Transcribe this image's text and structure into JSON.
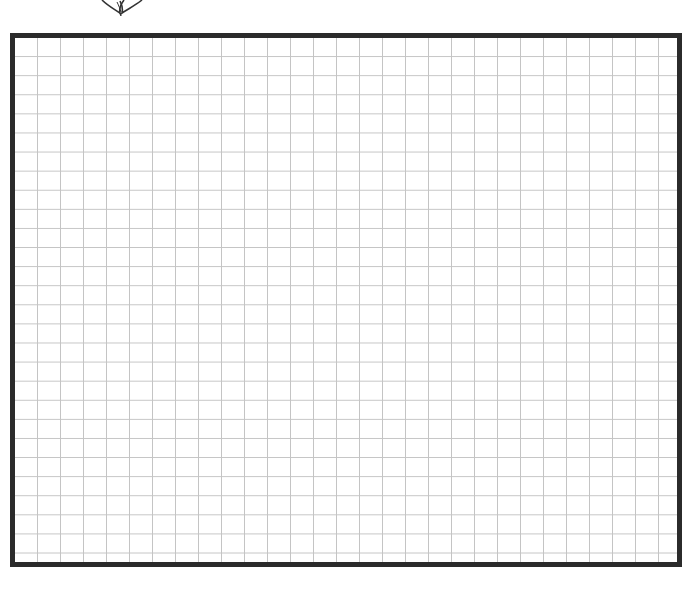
{
  "page": {
    "colors": {
      "border": "#2b2b2b",
      "grid_line": "#c4c4c4",
      "background": "#ffffff",
      "ornament": "#333333"
    }
  },
  "ornament": {
    "icon": "leaf-ornament-icon",
    "partially_visible": true
  },
  "grid": {
    "columns": 29,
    "rows": 28,
    "content": ""
  }
}
